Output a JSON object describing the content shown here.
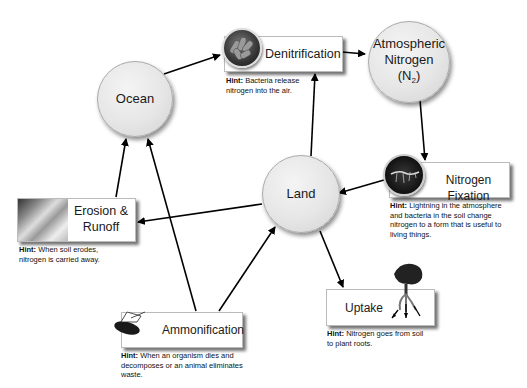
{
  "diagram": {
    "hint_prefix": "Hint:",
    "reservoirs": {
      "ocean": {
        "label": "Ocean"
      },
      "atmosphere": {
        "label_line1": "Atmospheric",
        "label_line2": "Nitrogen",
        "label_formula_open": "(N",
        "label_formula_sub": "2",
        "label_formula_close": ")"
      },
      "land": {
        "label": "Land"
      }
    },
    "processes": {
      "denitrification": {
        "label": "Denitrification",
        "icon": "bacteria-icon",
        "hint": "Bacteria release nitrogen into the air."
      },
      "nitrogen_fixation": {
        "label": "Nitrogen Fixation",
        "icon": "lightning-icon",
        "hint": "Lightning in the atmosphere and bacteria in the soil change nitrogen to a form that is useful to living things."
      },
      "erosion": {
        "label_line1": "Erosion &",
        "label_line2": "Runoff",
        "icon": "water-erosion-icon",
        "hint": "When soil erodes, nitrogen is carried away."
      },
      "ammonification": {
        "label": "Ammonification",
        "icon": "dead-insect-icon",
        "hint": "When an organism dies and decomposes or an animal eliminates waste."
      },
      "uptake": {
        "label": "Uptake",
        "icon": "plant-roots-icon",
        "hint": "Nitrogen goes from soil to plant roots."
      }
    },
    "edges": [
      {
        "from": "Ocean",
        "to": "Denitrification"
      },
      {
        "from": "Denitrification",
        "to": "Atmospheric Nitrogen"
      },
      {
        "from": "Atmospheric Nitrogen",
        "to": "Nitrogen Fixation"
      },
      {
        "from": "Nitrogen Fixation",
        "to": "Land"
      },
      {
        "from": "Land",
        "to": "Denitrification"
      },
      {
        "from": "Land",
        "to": "Erosion & Runoff"
      },
      {
        "from": "Land",
        "to": "Uptake"
      },
      {
        "from": "Erosion & Runoff",
        "to": "Ocean"
      },
      {
        "from": "Ammonification",
        "to": "Ocean"
      },
      {
        "from": "Ammonification",
        "to": "Land"
      }
    ],
    "colors": {
      "circle_fill": "#e6e6e6",
      "arrow": "#000000",
      "box_fill": "#ffffff"
    }
  }
}
